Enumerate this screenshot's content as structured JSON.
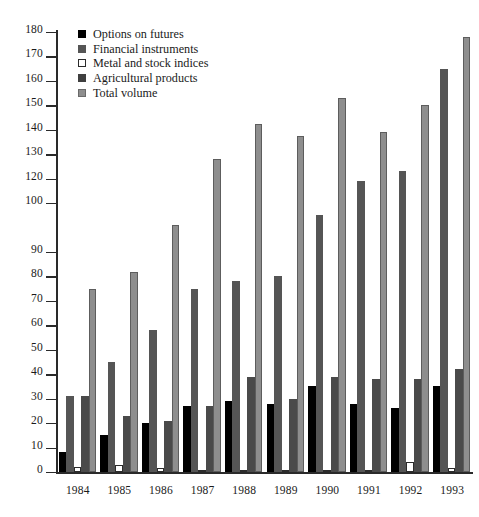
{
  "chart_data": {
    "type": "bar",
    "title": "",
    "subtitle": "",
    "xlabel": "",
    "ylabel": "",
    "categories": [
      "1984",
      "1985",
      "1986",
      "1987",
      "1988",
      "1989",
      "1990",
      "1991",
      "1992",
      "1993"
    ],
    "ylim": [
      0,
      180
    ],
    "yticks": [
      0,
      10,
      20,
      30,
      40,
      50,
      60,
      70,
      80,
      90,
      100,
      120,
      130,
      140,
      150,
      160,
      170,
      180
    ],
    "ytick_labels": [
      "0",
      "10",
      "20",
      "30",
      "40",
      "50",
      "60",
      "70",
      "80",
      "90",
      "100",
      "120",
      "130",
      "140",
      "150",
      "160",
      "170",
      "180"
    ],
    "ytick_values": [
      0,
      10,
      20,
      30,
      40,
      50,
      60,
      70,
      80,
      90,
      110,
      120,
      130,
      140,
      150,
      160,
      170,
      180
    ],
    "grid": false,
    "legend_position": "top-left",
    "series": [
      {
        "name": "Options on futures",
        "color": "#000000",
        "values": [
          8,
          15,
          20,
          27,
          29,
          28,
          35,
          28,
          26,
          35
        ]
      },
      {
        "name": "Financial instruments",
        "color": "#555555",
        "values": [
          31,
          45,
          58,
          75,
          78,
          80,
          105,
          119,
          123,
          165
        ]
      },
      {
        "name": "Metal and stock indices",
        "color": "#ffffff",
        "values": [
          2,
          3,
          1.5,
          1,
          1,
          1,
          1,
          1,
          4,
          1.5
        ]
      },
      {
        "name": "Agricultural products",
        "color": "#4a4a4a",
        "values": [
          31,
          23,
          21,
          27,
          39,
          30,
          39,
          38,
          38,
          42
        ]
      },
      {
        "name": "Total volume",
        "color": "#8e8e8e",
        "values": [
          75,
          82,
          101,
          128,
          142.5,
          137.5,
          153,
          139,
          150,
          178
        ]
      }
    ]
  },
  "legend": {
    "items": [
      {
        "label": "Options on futures",
        "swatch": "swatch-black"
      },
      {
        "label": "Financial instruments",
        "swatch": "swatch-dark-gray"
      },
      {
        "label": "Metal and stock indices",
        "swatch": "swatch-white"
      },
      {
        "label": "Agricultural products",
        "swatch": "swatch-textured-dark"
      },
      {
        "label": "Total volume",
        "swatch": "swatch-light-gray"
      }
    ]
  }
}
